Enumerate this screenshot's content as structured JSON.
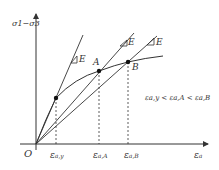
{
  "diagram": {
    "y_axis_label": "σ1−σ3",
    "x_axis_label": "εa",
    "origin_label": "O",
    "points": {
      "yield": {
        "x": 56,
        "y": 98
      },
      "A": {
        "label": "A",
        "x": 99,
        "y": 71
      },
      "B": {
        "label": "B",
        "x": 128,
        "y": 62
      }
    },
    "slope_label": "E",
    "x_ticks": [
      {
        "main": "ε",
        "sub": "a,y"
      },
      {
        "main": "ε",
        "sub": "a,A"
      },
      {
        "main": "ε",
        "sub": "a,B"
      }
    ],
    "inequality": "εa,y < εa,A < εa,B",
    "line_color": "#333333"
  }
}
